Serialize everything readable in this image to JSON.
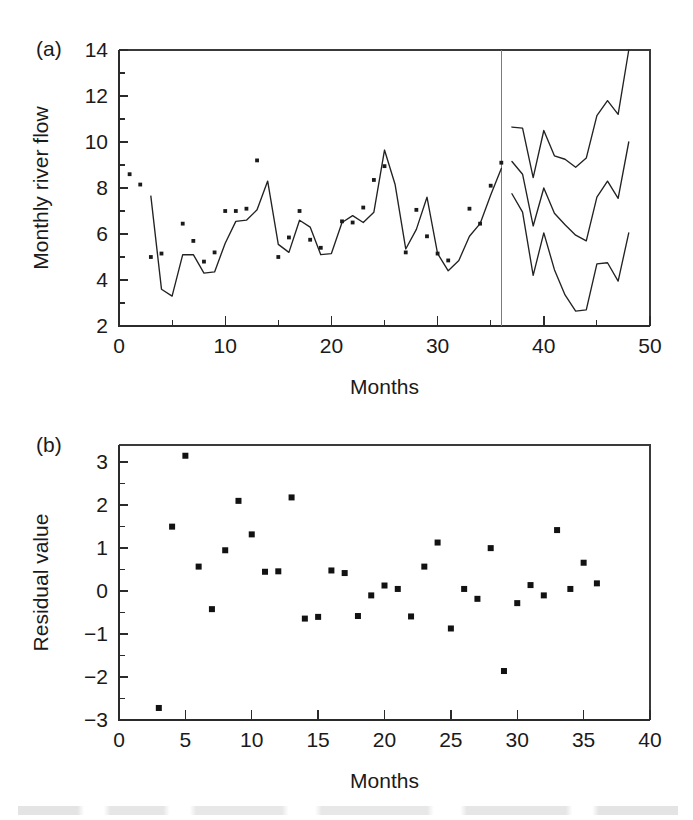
{
  "figure": {
    "panel_a_tag": "(a)",
    "panel_b_tag": "(b)"
  },
  "chart_data": [
    {
      "id": "panel-a",
      "type": "line",
      "title": "",
      "panel_label": "(a)",
      "xlabel": "Months",
      "ylabel": "Monthly river flow",
      "xlim": [
        0,
        50
      ],
      "ylim": [
        2,
        14
      ],
      "xticks": [
        0,
        10,
        20,
        30,
        40,
        50
      ],
      "xtick_labels": [
        "0",
        "10",
        "20",
        "30",
        "40",
        "50"
      ],
      "x_minor_step": 5,
      "yticks": [
        2,
        4,
        6,
        8,
        10,
        12,
        14
      ],
      "ytick_labels": [
        "2",
        "4",
        "6",
        "8",
        "10",
        "12",
        "14"
      ],
      "y_minor_step": 1,
      "grid": false,
      "legend": "none",
      "forecast_divider_x": 36,
      "series": [
        {
          "name": "Fitted river flow",
          "kind": "line",
          "x": [
            3,
            4,
            5,
            6,
            7,
            8,
            9,
            10,
            11,
            12,
            13,
            14,
            15,
            16,
            17,
            18,
            19,
            20,
            21,
            22,
            23,
            24,
            25,
            26,
            27,
            28,
            29,
            30,
            31,
            32,
            33,
            34,
            35,
            36
          ],
          "values": [
            7.65,
            3.6,
            3.3,
            5.1,
            5.1,
            4.3,
            4.35,
            5.6,
            6.55,
            6.6,
            7.05,
            8.3,
            5.55,
            5.2,
            6.6,
            6.3,
            5.1,
            5.15,
            6.5,
            6.8,
            6.5,
            6.95,
            9.65,
            8.15,
            5.35,
            6.2,
            7.6,
            5.15,
            4.4,
            4.85,
            5.9,
            6.45,
            7.7,
            8.85
          ]
        },
        {
          "name": "Observed river flow",
          "kind": "scatter",
          "x": [
            1,
            2,
            3,
            4,
            6,
            7,
            8,
            9,
            10,
            11,
            12,
            13,
            15,
            16,
            17,
            18,
            19,
            21,
            22,
            23,
            24,
            25,
            27,
            28,
            29,
            30,
            31,
            33,
            34,
            35,
            36
          ],
          "values": [
            8.6,
            8.15,
            5.0,
            5.15,
            6.45,
            5.7,
            4.8,
            5.2,
            7.0,
            7.0,
            7.1,
            9.2,
            5.0,
            5.85,
            7.0,
            5.75,
            5.4,
            6.55,
            6.5,
            7.15,
            8.35,
            8.95,
            5.2,
            7.05,
            5.9,
            5.15,
            4.85,
            7.1,
            6.45,
            8.1,
            9.1
          ]
        },
        {
          "name": "Forecast upper bound",
          "kind": "line",
          "x": [
            37,
            38,
            39,
            40,
            41,
            42,
            43,
            44,
            45,
            46,
            47,
            48
          ],
          "values": [
            10.65,
            10.6,
            8.45,
            10.5,
            9.4,
            9.25,
            8.9,
            9.3,
            11.15,
            11.8,
            11.2,
            14.0
          ]
        },
        {
          "name": "Forecast mean",
          "kind": "line",
          "x": [
            37,
            38,
            39,
            40,
            41,
            42,
            43,
            44,
            45,
            46,
            47,
            48
          ],
          "values": [
            9.15,
            8.6,
            6.35,
            8.0,
            6.9,
            6.4,
            5.95,
            5.7,
            7.6,
            8.3,
            7.55,
            10.0
          ]
        },
        {
          "name": "Forecast lower bound",
          "kind": "line",
          "x": [
            37,
            38,
            39,
            40,
            41,
            42,
            43,
            44,
            45,
            46,
            47,
            48
          ],
          "values": [
            7.75,
            6.95,
            4.2,
            6.05,
            4.45,
            3.35,
            2.65,
            2.7,
            4.7,
            4.75,
            3.95,
            6.05
          ]
        }
      ]
    },
    {
      "id": "panel-b",
      "type": "scatter",
      "title": "",
      "panel_label": "(b)",
      "xlabel": "Months",
      "ylabel": "Residual value",
      "xlim": [
        0,
        40
      ],
      "ylim": [
        -3,
        3.4
      ],
      "xticks": [
        0,
        5,
        10,
        15,
        20,
        25,
        30,
        35,
        40
      ],
      "xtick_labels": [
        "0",
        "5",
        "10",
        "15",
        "20",
        "25",
        "30",
        "35",
        "40"
      ],
      "yticks": [
        -3,
        -2,
        -1,
        0,
        1,
        2,
        3
      ],
      "ytick_labels": [
        "−3",
        "−2",
        "−1",
        "0",
        "1",
        "2",
        "3"
      ],
      "y_minor_step": 0.5,
      "grid": false,
      "legend": "none",
      "series": [
        {
          "name": "Residuals",
          "kind": "scatter",
          "x": [
            3,
            4,
            5,
            6,
            7,
            8,
            9,
            10,
            11,
            12,
            13,
            14,
            15,
            16,
            17,
            18,
            19,
            20,
            21,
            22,
            23,
            24,
            25,
            26,
            27,
            28,
            29,
            30,
            31,
            32,
            33,
            34,
            35,
            36
          ],
          "values": [
            -2.72,
            1.5,
            3.15,
            0.57,
            -0.42,
            0.95,
            2.1,
            1.32,
            0.45,
            0.46,
            2.18,
            -0.64,
            -0.6,
            0.48,
            0.42,
            -0.58,
            -0.1,
            0.13,
            0.05,
            -0.59,
            0.57,
            1.13,
            -0.87,
            0.05,
            -0.18,
            1.0,
            -1.86,
            -0.28,
            0.14,
            -0.1,
            1.42,
            0.05,
            0.66,
            0.18
          ]
        }
      ]
    }
  ]
}
